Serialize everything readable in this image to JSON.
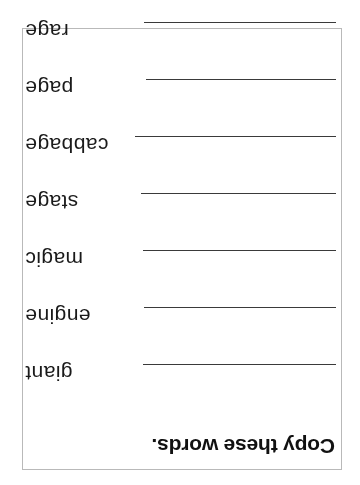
{
  "worksheet": {
    "title": "Copy these words.",
    "orientation": "upside-down",
    "border_color": "#b9b9b9",
    "line_color": "#3a3a3a",
    "text_color": "#1a1a1a",
    "background": "#ffffff",
    "rows": [
      {
        "word": "giant",
        "line_label": "writing line for giant"
      },
      {
        "word": "engine",
        "line_label": "writing line for engine"
      },
      {
        "word": "magic",
        "line_label": "writing line for magic"
      },
      {
        "word": "stage",
        "line_label": "writing line for stage"
      },
      {
        "word": "cabbage",
        "line_label": "writing line for cabbage"
      },
      {
        "word": "page",
        "line_label": "writing line for page"
      },
      {
        "word": "rage",
        "line_label": "writing line for rage"
      }
    ]
  }
}
